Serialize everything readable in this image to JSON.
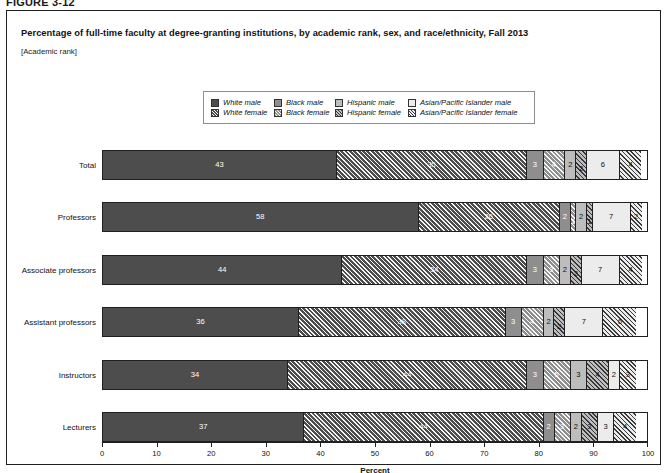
{
  "figure_label": "FIGURE 3-12",
  "title": "Percentage of full-time faculty at degree-granting institutions, by academic rank, sex, and race/ethnicity, Fall 2013",
  "subtitle": "[Academic rank]",
  "legend": {
    "rows": [
      [
        {
          "label": "White male",
          "swatch": "white-male-swatch",
          "fill": "f-wm",
          "width_class": "lg-w"
        },
        {
          "label": "Black male",
          "swatch": "black-male-swatch",
          "fill": "f-bm",
          "width_class": "lg-b"
        },
        {
          "label": "Hispanic male",
          "swatch": "hispanic-male-swatch",
          "fill": "f-hm",
          "width_class": "lg-h"
        },
        {
          "label": "Asian/Pacific Islander male",
          "swatch": "asian-pacific-islander-male-swatch",
          "fill": "f-am",
          "width_class": "lg-a"
        }
      ],
      [
        {
          "label": "White female",
          "swatch": "white-female-swatch",
          "fill": "f-wf",
          "width_class": "lg-w"
        },
        {
          "label": "Black female",
          "swatch": "black-female-swatch",
          "fill": "f-bf",
          "width_class": "lg-b"
        },
        {
          "label": "Hispanic female",
          "swatch": "hispanic-female-swatch",
          "fill": "f-hf",
          "width_class": "lg-h"
        },
        {
          "label": "Asian/Pacific Islander female",
          "swatch": "asian-pacific-islander-female-swatch",
          "fill": "f-af",
          "width_class": "lg-a"
        }
      ]
    ]
  },
  "colors": {
    "white_male": "#4d4d4d",
    "black_male": "#8e8e8e",
    "hispanic_male": "#bdbdbd",
    "asian_male": "#ececec",
    "border": "#231f20",
    "panel_border": "#231f20"
  },
  "chart_data": {
    "type": "bar",
    "orientation": "horizontal",
    "stacked": true,
    "title": "Percentage of full-time faculty at degree-granting institutions, by academic rank, sex, and race/ethnicity, Fall 2013",
    "subtitle": "[Academic rank]",
    "xlabel": "Percent",
    "ylabel": "",
    "xlim": [
      0,
      100
    ],
    "xticks": [
      0,
      10,
      20,
      30,
      40,
      50,
      60,
      70,
      80,
      90,
      100
    ],
    "grid": false,
    "legend_position": "top-center",
    "categories": [
      "Total",
      "Professors",
      "Associate professors",
      "Assistant professors",
      "Instructors",
      "Lecturers"
    ],
    "series": [
      {
        "name": "White male",
        "fill": "f-wm",
        "values": [
          43,
          58,
          44,
          36,
          34,
          37
        ]
      },
      {
        "name": "White female",
        "fill": "f-wf",
        "values": [
          35,
          26,
          34,
          38,
          44,
          44
        ]
      },
      {
        "name": "Black male",
        "fill": "f-bm",
        "values": [
          3,
          2,
          3,
          3,
          3,
          2
        ]
      },
      {
        "name": "Black female",
        "fill": "f-bf",
        "values": [
          4,
          1,
          3,
          4,
          5,
          3
        ]
      },
      {
        "name": "Hispanic male",
        "fill": "f-hm",
        "values": [
          2,
          2,
          2,
          2,
          3,
          2
        ]
      },
      {
        "name": "Hispanic female",
        "fill": "f-hf",
        "values": [
          2,
          1,
          2,
          2,
          4,
          3
        ]
      },
      {
        "name": "Asian/Pacific Islander male",
        "fill": "f-am",
        "values": [
          6,
          7,
          7,
          7,
          2,
          3
        ]
      },
      {
        "name": "Asian/Pacific Islander female",
        "fill": "f-af",
        "values": [
          4,
          2,
          4,
          6,
          3,
          4
        ]
      }
    ]
  },
  "axis": {
    "title": "Percent",
    "ticks": [
      "0",
      "10",
      "20",
      "30",
      "40",
      "50",
      "60",
      "70",
      "80",
      "90",
      "100"
    ]
  }
}
